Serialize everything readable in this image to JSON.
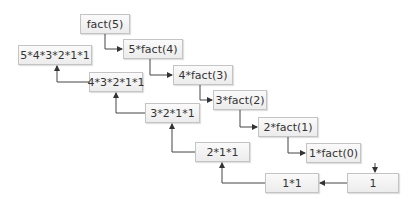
{
  "diagram": {
    "calls": [
      {
        "id": "c5",
        "label": "fact(5)"
      },
      {
        "id": "c4",
        "label": "5*fact(4)"
      },
      {
        "id": "c3",
        "label": "4*fact(3)"
      },
      {
        "id": "c2",
        "label": "3*fact(2)"
      },
      {
        "id": "c1",
        "label": "2*fact(1)"
      },
      {
        "id": "c0",
        "label": "1*fact(0)"
      }
    ],
    "returns": [
      {
        "id": "r0",
        "label": "1"
      },
      {
        "id": "r1",
        "label": "1*1"
      },
      {
        "id": "r2",
        "label": "2*1*1"
      },
      {
        "id": "r3",
        "label": "3*2*1*1"
      },
      {
        "id": "r4",
        "label": "4*3*2*1*1"
      },
      {
        "id": "r5",
        "label": "5*4*3*2*1*1"
      }
    ],
    "colors": {
      "box_border": "#c4c4c4",
      "box_fill": "#f2f2f2",
      "arrow": "#333333",
      "text": "#333333"
    }
  }
}
